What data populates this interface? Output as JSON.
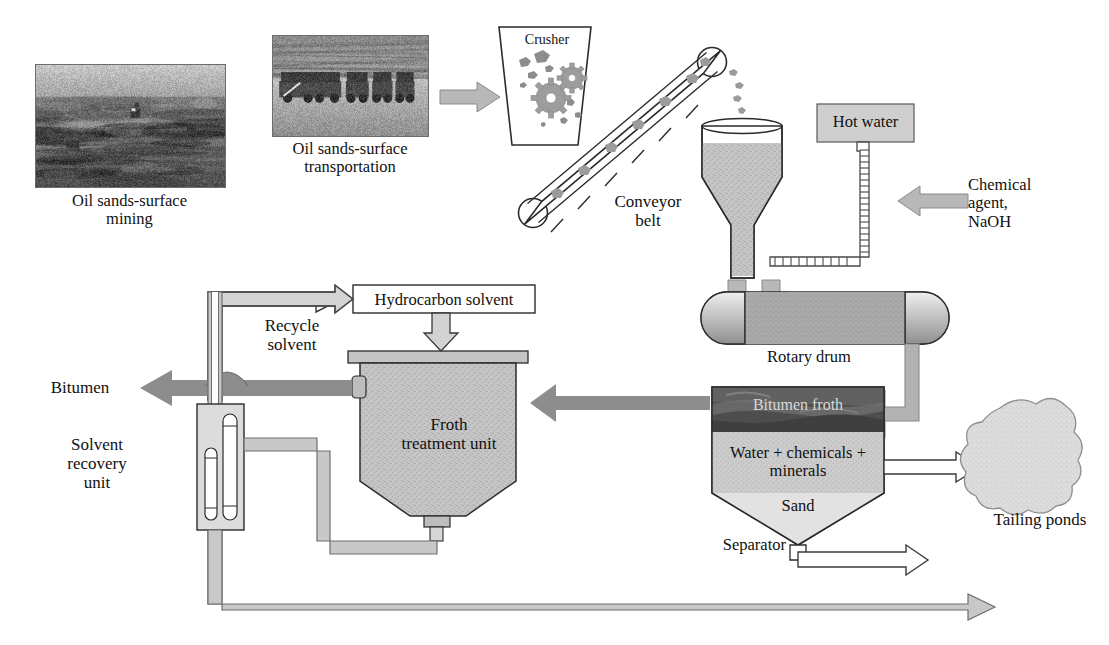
{
  "diagram": {
    "type": "process-flow-diagram"
  },
  "colors": {
    "pipe_fill": "#c9c9c9",
    "pipe_stroke": "#6e6e6e",
    "arrow_solid": "#8f8f8f",
    "arrow_dark": "#7a7a7a",
    "vessel_fill": "#c2c2c2",
    "box_fill": "#cccccc",
    "outline": "#2b2b2b",
    "pond_fill": "#dedede",
    "froth_dark": "#4a4a4a",
    "text": "#111111"
  },
  "photos": {
    "mining": {
      "caption_line1": "Oil sands-surface",
      "caption_line2": "mining",
      "alt": "open pit oil sands surface mine"
    },
    "transportation": {
      "caption_line1": "Oil sands-surface",
      "caption_line2": "transportation",
      "alt": "haul trucks in oil sands mine"
    }
  },
  "units": {
    "crusher": {
      "label": "Crusher"
    },
    "conveyor": {
      "label_line1": "Conveyor",
      "label_line2": "belt"
    },
    "surge_bin": {
      "label": ""
    },
    "hot_water": {
      "label": "Hot water"
    },
    "chemical_agent": {
      "label_line1": "Chemical",
      "label_line2": "agent,",
      "label_line3": "NaOH"
    },
    "rotary_drum": {
      "label": "Rotary drum"
    },
    "separator": {
      "label": "Separator",
      "layer_froth": "Bitumen froth",
      "layer_middlings_line1": "Water + chemicals +",
      "layer_middlings_line2": "minerals",
      "layer_sand": "Sand"
    },
    "froth_treatment": {
      "label_line1": "Froth",
      "label_line2": "treatment unit"
    },
    "hydrocarbon_solvent": {
      "label": "Hydrocarbon solvent"
    },
    "recycle_solvent": {
      "label_line1": "Recycle",
      "label_line2": "solvent"
    },
    "solvent_recovery": {
      "label_line1": "Solvent",
      "label_line2": "recovery",
      "label_line3": "unit"
    },
    "tailing_ponds": {
      "label": "Tailing ponds"
    },
    "bitumen_outlet": {
      "label": "Bitumen"
    }
  },
  "streams": [
    {
      "name": "ore-to-crusher",
      "from": "transportation",
      "to": "crusher",
      "style": "block-arrow-filled"
    },
    {
      "name": "crushed-ore-conveyor",
      "from": "crusher",
      "to": "surge-bin",
      "style": "conveyor"
    },
    {
      "name": "ore-to-drum",
      "from": "surge-bin",
      "to": "rotary-drum",
      "style": "block-arrow-filled"
    },
    {
      "name": "hot-water-to-drum",
      "from": "hot-water",
      "to": "rotary-drum",
      "style": "hatched-pipe"
    },
    {
      "name": "chemical-to-water",
      "from": "chemical-agent",
      "to": "hot-water-pipe",
      "style": "block-arrow-filled"
    },
    {
      "name": "slurry-to-separator",
      "from": "rotary-drum",
      "to": "separator",
      "style": "thick-pipe-elbow"
    },
    {
      "name": "froth-to-treatment",
      "from": "separator",
      "to": "froth-treatment",
      "style": "solid-arrow"
    },
    {
      "name": "middlings-to-ponds",
      "from": "separator",
      "to": "tailing-ponds",
      "style": "outline-arrow"
    },
    {
      "name": "sand-to-ponds",
      "from": "separator",
      "to": "tailing-ponds",
      "style": "outline-arrow"
    },
    {
      "name": "solvent-to-treatment",
      "from": "hydrocarbon-solvent",
      "to": "froth-treatment",
      "style": "outline-arrow"
    },
    {
      "name": "recycle-to-solvent",
      "from": "solvent-recovery",
      "to": "hydrocarbon-solvent",
      "style": "outline-arrow"
    },
    {
      "name": "product-bitumen",
      "from": "froth-treatment",
      "to": "bitumen-outlet",
      "style": "solid-arrow"
    },
    {
      "name": "bottoms-to-recovery",
      "from": "froth-treatment",
      "to": "solvent-recovery",
      "style": "pipe"
    },
    {
      "name": "recovery-bottoms-to-ponds",
      "from": "solvent-recovery",
      "to": "tailing-ponds",
      "style": "pipe-arrow"
    }
  ]
}
